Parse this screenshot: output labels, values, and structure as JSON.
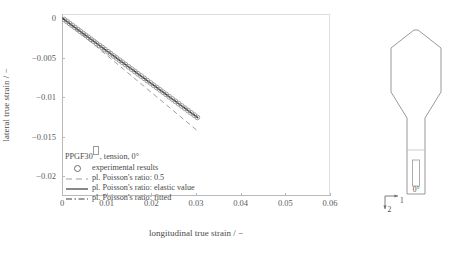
{
  "chart_data": {
    "type": "line",
    "title": "",
    "xlabel": "longitudinal true strain / −",
    "ylabel": "lateral true strain / −",
    "xlim": [
      0,
      0.06
    ],
    "ylim": [
      -0.0225,
      0.0005
    ],
    "xticks": [
      "0",
      "0.01",
      "0.02",
      "0.03",
      "0.04",
      "0.05",
      "0.06"
    ],
    "xtick_values": [
      0,
      0.01,
      0.02,
      0.03,
      0.04,
      0.05,
      0.06
    ],
    "yticks": [
      "0",
      "−0.005",
      "−0.01",
      "−0.015",
      "−0.02"
    ],
    "ytick_values": [
      0,
      -0.005,
      -0.01,
      -0.015,
      -0.02
    ],
    "grid": false,
    "legend_position": "lower-left-inside",
    "legend_title": "PPGF30",
    "legend_title_suffix": ", tension, 0°",
    "series": [
      {
        "name": "experimental results",
        "style": "circles",
        "color": "#8a8a8a",
        "x": [
          0.0005,
          0.0011,
          0.0017,
          0.0023,
          0.0029,
          0.0035,
          0.0041,
          0.0047,
          0.0053,
          0.0059,
          0.0065,
          0.0071,
          0.0077,
          0.0084,
          0.009,
          0.0096,
          0.0103,
          0.0109,
          0.0116,
          0.0122,
          0.0129,
          0.0135,
          0.0142,
          0.0149,
          0.0156,
          0.0163,
          0.017,
          0.0177,
          0.0184,
          0.0191,
          0.0198,
          0.0205,
          0.0212,
          0.0219,
          0.0226,
          0.0233,
          0.024,
          0.0247,
          0.0254,
          0.0261,
          0.0268,
          0.0275,
          0.0282,
          0.0289,
          0.0296,
          0.0303
        ],
        "y": [
          -0.0002,
          -0.00045,
          -0.0007,
          -0.00095,
          -0.0012,
          -0.00145,
          -0.0017,
          -0.00195,
          -0.0022,
          -0.00245,
          -0.0027,
          -0.00295,
          -0.0032,
          -0.00348,
          -0.00373,
          -0.00398,
          -0.00427,
          -0.00452,
          -0.00481,
          -0.00506,
          -0.00535,
          -0.0056,
          -0.00589,
          -0.00618,
          -0.00647,
          -0.00676,
          -0.00705,
          -0.00734,
          -0.00763,
          -0.00792,
          -0.00821,
          -0.0085,
          -0.00879,
          -0.00908,
          -0.00937,
          -0.00966,
          -0.00996,
          -0.01025,
          -0.01054,
          -0.01083,
          -0.01112,
          -0.01141,
          -0.0117,
          -0.01199,
          -0.01228,
          -0.01257
        ]
      },
      {
        "name": "pl. Poisson's ratio: 0.5",
        "style": "dashed",
        "color": "#9e9e9e",
        "slope": -0.47,
        "x": [
          0,
          0.0305
        ],
        "y": [
          0,
          -0.01434
        ]
      },
      {
        "name": "pl. Poisson's ratio: elastic value",
        "style": "solid",
        "color": "#555555",
        "slope": -0.415,
        "x": [
          0,
          0.0305
        ],
        "y": [
          0,
          -0.01266
        ]
      },
      {
        "name": "pl. Poisson's ratio: fitted",
        "style": "dashdot",
        "color": "#3c3c3c",
        "slope": -0.413,
        "x": [
          0,
          0.0305
        ],
        "y": [
          0,
          -0.0126
        ]
      }
    ]
  },
  "legend": {
    "title_main": "PPGF30",
    "title_rest": ", tension, 0°",
    "entries": [
      {
        "key": "circle",
        "label": "experimental results"
      },
      {
        "key": "dashed",
        "label": "pl. Poisson's ratio: 0.5"
      },
      {
        "key": "solid",
        "label": "pl. Poisson's ratio: elastic value"
      },
      {
        "key": "dashdot",
        "label": "pl. Poisson's ratio: fitted"
      }
    ]
  },
  "specimen": {
    "angle_label": "0°",
    "axis_1_label": "1",
    "axis_2_label": "2"
  }
}
